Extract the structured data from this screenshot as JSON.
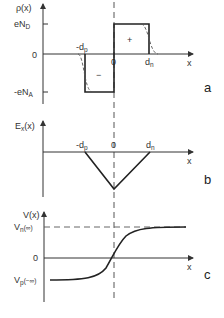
{
  "figure": {
    "panels": [
      {
        "id": "a",
        "panel_label": "a",
        "y_axis_label": "ρ(x)",
        "x_axis_label": "x",
        "y_ticks": [
          {
            "label_main": "eN",
            "label_sub": "D",
            "meaning": "positive donor charge density"
          },
          {
            "label_main": "0",
            "label_sub": ""
          },
          {
            "label_main": "-eN",
            "label_sub": "A",
            "meaning": "negative acceptor charge density"
          }
        ],
        "x_ticks": [
          {
            "label_main": "-d",
            "label_sub": "p"
          },
          {
            "label_main": "0",
            "label_sub": ""
          },
          {
            "label_main": "d",
            "label_sub": "n"
          }
        ],
        "region_signs": {
          "negative": "−",
          "positive": "+"
        },
        "description": "Abrupt-junction charge density (solid boxes) with smoothed real distribution (dashed)"
      },
      {
        "id": "b",
        "panel_label": "b",
        "y_axis_label": "E",
        "y_axis_label_sub": "x",
        "y_axis_label_arg": "(x)",
        "x_axis_label": "x",
        "x_ticks": [
          {
            "label_main": "-d",
            "label_sub": "p"
          },
          {
            "label_main": "0",
            "label_sub": ""
          },
          {
            "label_main": "d",
            "label_sub": "n"
          }
        ],
        "description": "Electric field: triangular, minimum at x=0"
      },
      {
        "id": "c",
        "panel_label": "c",
        "y_axis_label": "V(x)",
        "x_axis_label": "x",
        "y_ticks": [
          {
            "label_main": "V",
            "label_sub": "n",
            "label_arg": "(∞)"
          },
          {
            "label_main": "0",
            "label_sub": ""
          },
          {
            "label_main": "V",
            "label_sub": "p",
            "label_arg": "(−∞)"
          }
        ],
        "description": "Electrostatic potential: S-shaped curve from Vp(−∞) to Vn(∞)"
      }
    ]
  }
}
